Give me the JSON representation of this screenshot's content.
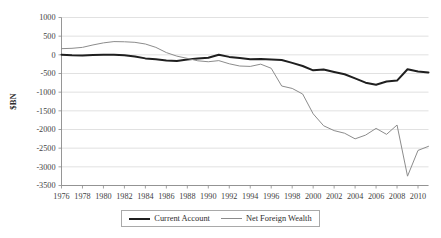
{
  "chart_data": {
    "type": "line",
    "title": "",
    "xlabel": "",
    "ylabel": "$BN",
    "ylim": [
      -3500,
      1000
    ],
    "xlim": [
      1976,
      2011
    ],
    "grid": true,
    "legend_position": "bottom",
    "ytick_labels": [
      "1000",
      "500",
      "0",
      "-500",
      "-1000",
      "-1500",
      "-2000",
      "-2500",
      "-3000",
      "-3500"
    ],
    "ytick_values": [
      1000,
      500,
      0,
      -500,
      -1000,
      -1500,
      -2000,
      -2500,
      -3000,
      -3500
    ],
    "xtick_labels": [
      "1976",
      "1978",
      "1980",
      "1982",
      "1984",
      "1986",
      "1988",
      "1990",
      "1992",
      "1994",
      "1996",
      "1998",
      "2000",
      "2002",
      "2004",
      "2006",
      "2008",
      "2010"
    ],
    "xtick_values": [
      1976,
      1978,
      1980,
      1982,
      1984,
      1986,
      1988,
      1990,
      1992,
      1994,
      1996,
      1998,
      2000,
      2002,
      2004,
      2006,
      2008,
      2010
    ],
    "x": [
      1976,
      1977,
      1978,
      1979,
      1980,
      1981,
      1982,
      1983,
      1984,
      1985,
      1986,
      1987,
      1988,
      1989,
      1990,
      1991,
      1992,
      1993,
      1994,
      1995,
      1996,
      1997,
      1998,
      1999,
      2000,
      2001,
      2002,
      2003,
      2004,
      2005,
      2006,
      2007,
      2008,
      2009,
      2010,
      2011
    ],
    "series": [
      {
        "name": "Current Account",
        "color": "#1f1f1f",
        "width": 2,
        "values": [
          5,
          -10,
          -15,
          -5,
          0,
          5,
          -10,
          -45,
          -95,
          -120,
          -150,
          -165,
          -125,
          -100,
          -80,
          0,
          -55,
          -85,
          -120,
          -110,
          -125,
          -140,
          -215,
          -300,
          -415,
          -395,
          -460,
          -520,
          -630,
          -745,
          -800,
          -715,
          -690,
          -385,
          -445,
          -470
        ]
      },
      {
        "name": "Net Foreign Wealth",
        "color": "#8c8c8c",
        "width": 1,
        "values": [
          165,
          175,
          200,
          265,
          320,
          355,
          350,
          335,
          290,
          200,
          60,
          -35,
          -95,
          -160,
          -185,
          -155,
          -240,
          -300,
          -310,
          -250,
          -360,
          -835,
          -900,
          -1050,
          -1580,
          -1900,
          -2030,
          -2100,
          -2250,
          -2150,
          -1970,
          -2130,
          -1880,
          -3250,
          -2560,
          -2450
        ]
      }
    ]
  },
  "legend": {
    "items": [
      {
        "label": "Current Account"
      },
      {
        "label": "Net Foreign Wealth"
      }
    ]
  },
  "axis": {
    "y_title": "$BN"
  }
}
